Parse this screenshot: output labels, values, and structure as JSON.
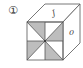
{
  "figure": {
    "label": "①",
    "top_face_symbol": "J",
    "right_face_symbol": "0",
    "front_face_pattern": "pinwheel of 4 shaded triangles",
    "colors": {
      "stroke": "#555555",
      "shade": "#bdbdbd",
      "background": "#ffffff"
    }
  }
}
